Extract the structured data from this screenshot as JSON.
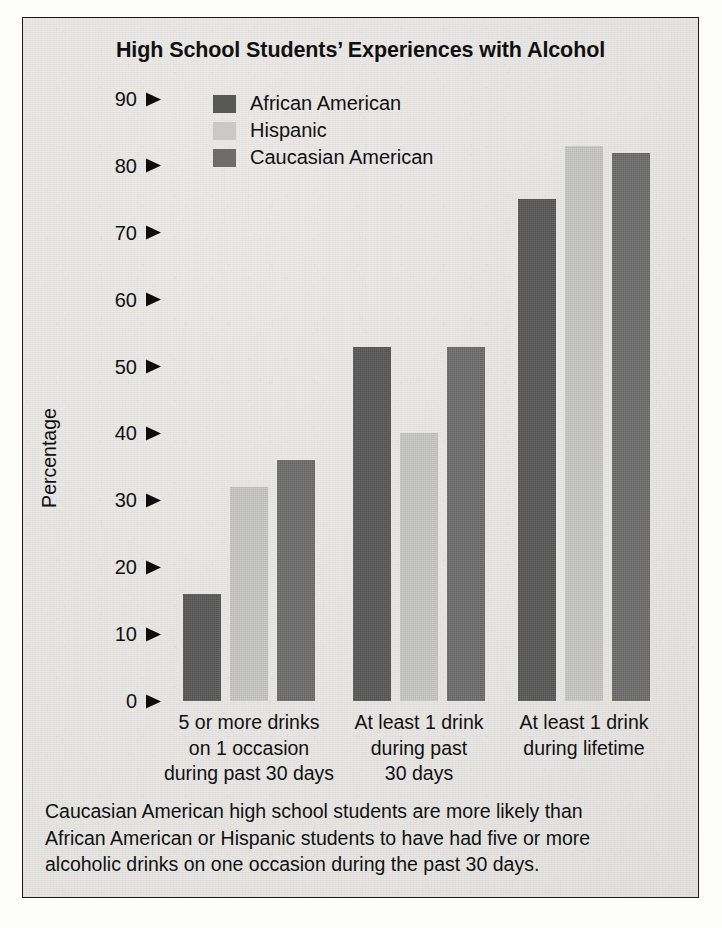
{
  "figure": {
    "title": "High School Students’ Experiences with Alcohol",
    "border_color": "#1c1c1c",
    "background_color": "#e7e6e3"
  },
  "caption": {
    "line1": "Caucasian American high school students are more likely than",
    "line2": "African American or Hispanic students to have had five or more",
    "line3": "alcoholic drinks on one occasion during the past 30 days."
  },
  "legend": {
    "position": "top-left-inside",
    "items": [
      {
        "label": "African American",
        "color": "#585858"
      },
      {
        "label": "Hispanic",
        "color": "#c9c9c7"
      },
      {
        "label": "Caucasian American",
        "color": "#6d6d6d"
      }
    ]
  },
  "axis": {
    "y_title": "Percentage",
    "y_ticks": [
      "90",
      "80",
      "70",
      "60",
      "50",
      "40",
      "30",
      "20",
      "10",
      "0"
    ],
    "tick_marker": "right-triangle-arrow"
  },
  "chart_data": {
    "type": "bar",
    "title": "High School Students’ Experiences with Alcohol",
    "xlabel": "",
    "ylabel": "Percentage",
    "ylim": [
      0,
      90
    ],
    "ytick_step": 10,
    "grid": false,
    "legend_position": "upper left",
    "categories": [
      "5 or more drinks\non 1 occasion\nduring past 30 days",
      "At least 1 drink\nduring past\n30 days",
      "At least 1 drink\nduring lifetime"
    ],
    "series": [
      {
        "name": "African American",
        "color": "#585858",
        "values": [
          16,
          53,
          75
        ]
      },
      {
        "name": "Hispanic",
        "color": "#c9c9c7",
        "values": [
          32,
          40,
          83
        ]
      },
      {
        "name": "Caucasian American",
        "color": "#6d6d6d",
        "values": [
          36,
          53,
          82
        ]
      }
    ],
    "annotation": "Caucasian American high school students are more likely than African American or Hispanic students to have had five or more alcoholic drinks on one occasion during the past 30 days."
  }
}
